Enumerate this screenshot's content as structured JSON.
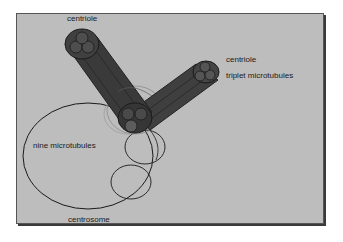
{
  "diagram": {
    "labels": {
      "centriole_top": "centriole",
      "centriole_right": "centriole",
      "triplet": "triplet microtubules",
      "nine": "nine microtubules",
      "centrosome": "centrosome"
    },
    "colors": {
      "background": "#bdbdbd",
      "cylinder": "#3d3d3d",
      "cylinder_dark": "#262626",
      "outline": "#1a1a1a"
    }
  }
}
